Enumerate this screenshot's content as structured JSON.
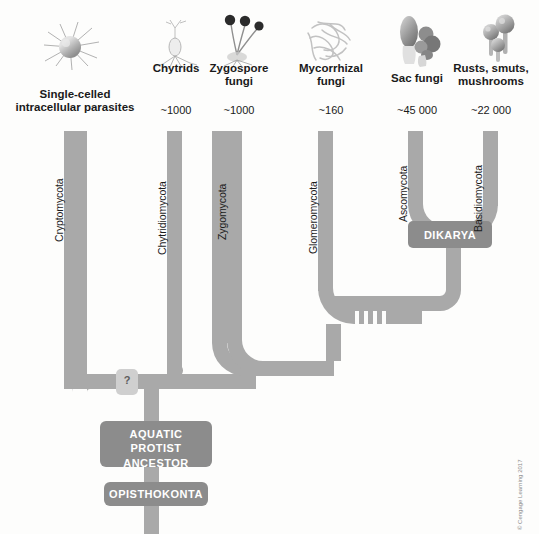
{
  "figure": {
    "background_color": "#fdfdfc",
    "branch_color": "#a9a9a9",
    "node_box_color": "#8c8c8c",
    "qmark_box_color": "#cfcfcf",
    "credit": "© Cengage Learning 2017"
  },
  "taxa": [
    {
      "id": "cryptomycota",
      "common_name": "Single-celled\nintracellular parasites",
      "common_name_line1": "Single-celled",
      "common_name_line2": "intracellular parasites",
      "species_count": "",
      "clade_name": "Cryptomycota",
      "icon": "spiked-sphere-cell-icon"
    },
    {
      "id": "chytridiomycota",
      "common_name_line1": "Chytrids",
      "common_name_line2": "",
      "species_count": "~1000",
      "clade_name": "Chytridiomycota",
      "icon": "chytrid-sporangium-icon"
    },
    {
      "id": "zygomycota",
      "common_name_line1": "Zygospore",
      "common_name_line2": "fungi",
      "species_count": "~1000",
      "clade_name": "Zygomycota",
      "icon": "zygospore-sporangiophore-icon"
    },
    {
      "id": "glomeromycota",
      "common_name_line1": "Mycorrhizal",
      "common_name_line2": "fungi",
      "species_count": "~160",
      "clade_name": "Glomeromycota",
      "icon": "mycorrhizal-hyphae-icon"
    },
    {
      "id": "ascomycota",
      "common_name_line1": "Sac fungi",
      "common_name_line2": "",
      "species_count": "~45 000",
      "clade_name": "Ascomycota",
      "icon": "sac-fungi-morel-icon"
    },
    {
      "id": "basidiomycota",
      "common_name_line1": "Rusts, smuts,",
      "common_name_line2": "mushrooms",
      "species_count": "~22 000",
      "clade_name": "Basidiomycota",
      "icon": "mushroom-cluster-icon"
    }
  ],
  "nodes": {
    "dikarya": "DIKARYA",
    "aquatic_protist_ancestor_line1": "AQUATIC",
    "aquatic_protist_ancestor_line2": "PROTIST",
    "aquatic_protist_ancestor_line3": "ANCESTOR",
    "opisthokonta": "OPISTHOKONTA",
    "uncertain_marker": "?"
  }
}
